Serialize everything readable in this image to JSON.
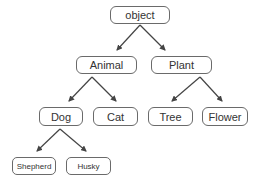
{
  "diagram": {
    "type": "tree",
    "nodes": [
      {
        "id": "object",
        "label": "object",
        "x": 110,
        "y": 6,
        "w": 60,
        "h": 18,
        "size": "normal"
      },
      {
        "id": "animal",
        "label": "Animal",
        "x": 76,
        "y": 56,
        "w": 61,
        "h": 18,
        "size": "normal"
      },
      {
        "id": "plant",
        "label": "Plant",
        "x": 151,
        "y": 56,
        "w": 61,
        "h": 18,
        "size": "normal"
      },
      {
        "id": "dog",
        "label": "Dog",
        "x": 39,
        "y": 107,
        "w": 44,
        "h": 19,
        "size": "normal"
      },
      {
        "id": "cat",
        "label": "Cat",
        "x": 93,
        "y": 107,
        "w": 45,
        "h": 19,
        "size": "normal"
      },
      {
        "id": "tree",
        "label": "Tree",
        "x": 148,
        "y": 107,
        "w": 45,
        "h": 19,
        "size": "normal"
      },
      {
        "id": "flower",
        "label": "Flower",
        "x": 202,
        "y": 107,
        "w": 46,
        "h": 19,
        "size": "normal"
      },
      {
        "id": "shepherd",
        "label": "Shepherd",
        "x": 12,
        "y": 157,
        "w": 44,
        "h": 18,
        "size": "small"
      },
      {
        "id": "husky",
        "label": "Husky",
        "x": 66,
        "y": 157,
        "w": 45,
        "h": 18,
        "size": "small"
      }
    ],
    "edges": [
      {
        "from": "object",
        "to": "animal",
        "x1": 140,
        "y1": 25,
        "x2": 117,
        "y2": 50
      },
      {
        "from": "object",
        "to": "plant",
        "x1": 140,
        "y1": 25,
        "x2": 165,
        "y2": 50
      },
      {
        "from": "animal",
        "to": "dog",
        "x1": 92,
        "y1": 77,
        "x2": 69,
        "y2": 101
      },
      {
        "from": "animal",
        "to": "cat",
        "x1": 92,
        "y1": 77,
        "x2": 116,
        "y2": 101
      },
      {
        "from": "plant",
        "to": "tree",
        "x1": 200,
        "y1": 77,
        "x2": 172,
        "y2": 101
      },
      {
        "from": "plant",
        "to": "flower",
        "x1": 200,
        "y1": 77,
        "x2": 222,
        "y2": 101
      },
      {
        "from": "dog",
        "to": "shepherd",
        "x1": 60,
        "y1": 129,
        "x2": 37,
        "y2": 151
      },
      {
        "from": "dog",
        "to": "husky",
        "x1": 60,
        "y1": 129,
        "x2": 86,
        "y2": 151
      }
    ],
    "colors": {
      "line": "#444444",
      "border": "#6a6a6a",
      "text": "#333333",
      "background": "#ffffff"
    }
  }
}
